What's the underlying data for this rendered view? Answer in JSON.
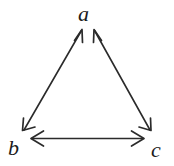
{
  "diagram": {
    "kind": "directed-graph-triangle",
    "background_color": "#ffffff",
    "stroke_color": "#2b2b2b",
    "label_color": "#1b1b1b",
    "nodes": [
      {
        "id": "a",
        "label": "a",
        "x": 87,
        "y": 14
      },
      {
        "id": "b",
        "label": "b",
        "x": 16,
        "y": 148
      },
      {
        "id": "c",
        "label": "c",
        "x": 158,
        "y": 150
      }
    ],
    "edges": [
      {
        "id": "edge-b-a",
        "from": "b",
        "to": "a",
        "style": "double-headed-arrow",
        "label": ""
      },
      {
        "id": "edge-a-c",
        "from": "a",
        "to": "c",
        "style": "double-headed-arrow",
        "label": ""
      },
      {
        "id": "edge-b-c",
        "from": "b",
        "to": "c",
        "style": "double-headed-arrow",
        "label": ""
      }
    ]
  }
}
